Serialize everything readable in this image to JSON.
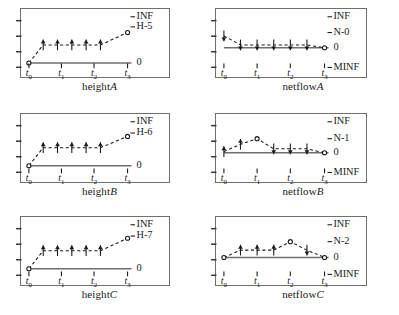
{
  "figure": {
    "background_color": "#ffffff",
    "box_border_color": "#6f6f6f",
    "line_color": "#1a1a1a",
    "columns": 2,
    "rows": 3
  },
  "panels": [
    {
      "id": "heightA",
      "caption_base": "height",
      "caption_system": "A",
      "column": "left",
      "row": 1,
      "right_labels": [
        "INF",
        "H−5",
        "0"
      ],
      "x_ticks": [
        "t0",
        "t1",
        "t2",
        "t3"
      ],
      "x_tick_labels": [
        "t",
        "t",
        "t",
        "t"
      ],
      "x_tick_subs": [
        "0",
        "1",
        "2",
        "3"
      ],
      "y_left_ticks": 4
    },
    {
      "id": "netflowA",
      "caption_base": "netflow",
      "caption_system": "A",
      "column": "right",
      "row": 1,
      "right_labels": [
        "INF",
        "N−0",
        "0",
        "MINF"
      ],
      "x_ticks": [
        "t0",
        "t1",
        "t2",
        "t3"
      ],
      "x_tick_labels": [
        "t",
        "t",
        "t",
        "t"
      ],
      "x_tick_subs": [
        "0",
        "1",
        "2",
        "3"
      ],
      "y_left_ticks": 4
    },
    {
      "id": "heightB",
      "caption_base": "height",
      "caption_system": "B",
      "column": "left",
      "row": 2,
      "right_labels": [
        "INF",
        "H−6",
        "0"
      ],
      "x_ticks": [
        "t0",
        "t1",
        "t2",
        "t3"
      ],
      "x_tick_labels": [
        "t",
        "t",
        "t",
        "t"
      ],
      "x_tick_subs": [
        "0",
        "1",
        "2",
        "3"
      ],
      "y_left_ticks": 4
    },
    {
      "id": "netflowB",
      "caption_base": "netflow",
      "caption_system": "B",
      "column": "right",
      "row": 2,
      "right_labels": [
        "INF",
        "N−1",
        "0",
        "MINF"
      ],
      "x_ticks": [
        "t0",
        "t1",
        "t2",
        "t3"
      ],
      "x_tick_labels": [
        "t",
        "t",
        "t",
        "t"
      ],
      "x_tick_subs": [
        "0",
        "1",
        "2",
        "3"
      ],
      "y_left_ticks": 4
    },
    {
      "id": "heightC",
      "caption_base": "height",
      "caption_system": "C",
      "column": "left",
      "row": 3,
      "right_labels": [
        "INF",
        "H−7",
        "0"
      ],
      "x_ticks": [
        "t0",
        "t1",
        "t2",
        "t3"
      ],
      "x_tick_labels": [
        "t",
        "t",
        "t",
        "t"
      ],
      "x_tick_subs": [
        "0",
        "1",
        "2",
        "3"
      ],
      "y_left_ticks": 4
    },
    {
      "id": "netflowC",
      "caption_base": "netflow",
      "caption_system": "C",
      "column": "right",
      "row": 3,
      "right_labels": [
        "INF",
        "N−2",
        "0",
        "MINF"
      ],
      "x_ticks": [
        "t0",
        "t1",
        "t2",
        "t3"
      ],
      "x_tick_labels": [
        "t",
        "t",
        "t",
        "t"
      ],
      "x_tick_subs": [
        "0",
        "1",
        "2",
        "3"
      ],
      "y_left_ticks": 4
    }
  ],
  "chart_data": [
    {
      "type": "line",
      "title": "heightA",
      "xlabel": "",
      "ylabel": "",
      "ylim": [
        0,
        1
      ],
      "grid": false,
      "legend": "none",
      "y_reference_levels": [
        {
          "label": "INF",
          "value": 1.0
        },
        {
          "label": "H-5",
          "value": 0.82
        },
        {
          "label": "0",
          "value": 0.18
        }
      ],
      "x_tick_values": [
        0,
        0.33,
        0.66,
        1.0
      ],
      "x_tick_labels": [
        "t0",
        "t1",
        "t2",
        "t3"
      ],
      "x": [
        0.0,
        0.145,
        0.29,
        0.435,
        0.58,
        0.725,
        1.0
      ],
      "values": [
        0.18,
        0.5,
        0.5,
        0.5,
        0.5,
        0.5,
        0.72
      ],
      "point_types": [
        "circle",
        "arrow-up",
        "arrow-up",
        "arrow-up",
        "arrow-up",
        "arrow-up",
        "circle"
      ],
      "baseline_value": 0.18
    },
    {
      "type": "line",
      "title": "netflowA",
      "xlabel": "",
      "ylabel": "",
      "ylim": [
        0,
        1
      ],
      "grid": false,
      "legend": "none",
      "y_reference_levels": [
        {
          "label": "INF",
          "value": 1.0
        },
        {
          "label": "N-0",
          "value": 0.72
        },
        {
          "label": "0",
          "value": 0.45
        },
        {
          "label": "MINF",
          "value": 0.1
        }
      ],
      "x_tick_values": [
        0,
        0.33,
        0.66,
        1.0
      ],
      "x_tick_labels": [
        "t0",
        "t1",
        "t2",
        "t3"
      ],
      "x": [
        0.0,
        0.165,
        0.33,
        0.495,
        0.66,
        0.825,
        1.0
      ],
      "values": [
        0.66,
        0.5,
        0.5,
        0.5,
        0.5,
        0.5,
        0.45
      ],
      "point_types": [
        "arrow-down",
        "arrow-down",
        "arrow-down",
        "arrow-down",
        "arrow-down",
        "arrow-down",
        "circle"
      ],
      "baseline_value": 0.45
    },
    {
      "type": "line",
      "title": "heightB",
      "xlabel": "",
      "ylabel": "",
      "ylim": [
        0,
        1
      ],
      "grid": false,
      "legend": "none",
      "y_reference_levels": [
        {
          "label": "INF",
          "value": 1.0
        },
        {
          "label": "H-6",
          "value": 0.8
        },
        {
          "label": "0",
          "value": 0.22
        }
      ],
      "x_tick_values": [
        0,
        0.33,
        0.66,
        1.0
      ],
      "x_tick_labels": [
        "t0",
        "t1",
        "t2",
        "t3"
      ],
      "x": [
        0.0,
        0.145,
        0.29,
        0.435,
        0.58,
        0.725,
        1.0
      ],
      "values": [
        0.22,
        0.54,
        0.54,
        0.54,
        0.54,
        0.54,
        0.74
      ],
      "point_types": [
        "circle",
        "arrow-up",
        "arrow-up",
        "arrow-up",
        "arrow-up",
        "arrow-up",
        "circle"
      ],
      "baseline_value": 0.22
    },
    {
      "type": "line",
      "title": "netflowB",
      "xlabel": "",
      "ylabel": "",
      "ylim": [
        0,
        1
      ],
      "grid": false,
      "legend": "none",
      "y_reference_levels": [
        {
          "label": "INF",
          "value": 1.0
        },
        {
          "label": "N-1",
          "value": 0.7
        },
        {
          "label": "0",
          "value": 0.45
        },
        {
          "label": "MINF",
          "value": 0.1
        }
      ],
      "x_tick_values": [
        0,
        0.33,
        0.66,
        1.0
      ],
      "x_tick_labels": [
        "t0",
        "t1",
        "t2",
        "t3"
      ],
      "x": [
        0.0,
        0.165,
        0.33,
        0.495,
        0.66,
        0.825,
        1.0
      ],
      "values": [
        0.47,
        0.6,
        0.7,
        0.52,
        0.52,
        0.52,
        0.45
      ],
      "point_types": [
        "arrow-up",
        "arrow-up",
        "circle",
        "arrow-down",
        "arrow-down",
        "arrow-down",
        "circle"
      ],
      "baseline_value": 0.45
    },
    {
      "type": "line",
      "title": "heightC",
      "xlabel": "",
      "ylabel": "",
      "ylim": [
        0,
        1
      ],
      "grid": false,
      "legend": "none",
      "y_reference_levels": [
        {
          "label": "INF",
          "value": 1.0
        },
        {
          "label": "H-7",
          "value": 0.8
        },
        {
          "label": "0",
          "value": 0.22
        }
      ],
      "x_tick_values": [
        0,
        0.33,
        0.66,
        1.0
      ],
      "x_tick_labels": [
        "t0",
        "t1",
        "t2",
        "t3"
      ],
      "x": [
        0.0,
        0.145,
        0.29,
        0.435,
        0.58,
        0.725,
        1.0
      ],
      "values": [
        0.22,
        0.54,
        0.54,
        0.54,
        0.54,
        0.54,
        0.76
      ],
      "point_types": [
        "circle",
        "arrow-up",
        "arrow-up",
        "arrow-up",
        "arrow-up",
        "arrow-up",
        "circle"
      ],
      "baseline_value": 0.22
    },
    {
      "type": "line",
      "title": "netflowC",
      "xlabel": "",
      "ylabel": "",
      "ylim": [
        0,
        1
      ],
      "grid": false,
      "legend": "none",
      "y_reference_levels": [
        {
          "label": "INF",
          "value": 1.0
        },
        {
          "label": "N-2",
          "value": 0.7
        },
        {
          "label": "0",
          "value": 0.42
        },
        {
          "label": "MINF",
          "value": 0.12
        }
      ],
      "x_tick_values": [
        0,
        0.33,
        0.66,
        1.0
      ],
      "x_tick_labels": [
        "t0",
        "t1",
        "t2",
        "t3"
      ],
      "x": [
        0.0,
        0.165,
        0.33,
        0.495,
        0.66,
        0.825,
        1.0
      ],
      "values": [
        0.42,
        0.55,
        0.55,
        0.55,
        0.7,
        0.55,
        0.42
      ],
      "point_types": [
        "circle",
        "arrow-up",
        "arrow-up",
        "arrow-up",
        "circle",
        "arrow-down",
        "circle"
      ],
      "baseline_value": 0.42
    }
  ]
}
